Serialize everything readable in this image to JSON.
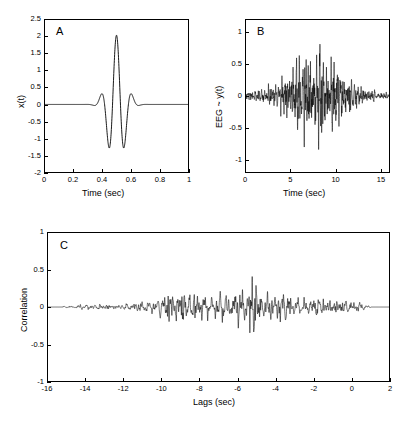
{
  "figure": {
    "background": "#ffffff",
    "line_color": "#000000",
    "panels": [
      {
        "id": "panel-a",
        "letter": "A",
        "xlabel": "Time (sec)",
        "ylabel": "x(t)",
        "xticks": [
          "0",
          "0.2",
          "0.4",
          "0.6",
          "0.8",
          "1"
        ],
        "yticks": [
          "2.5",
          "2",
          "1.5",
          "1",
          "0.5",
          "0",
          "-0.5",
          "-1",
          "-1.5",
          "-2"
        ]
      },
      {
        "id": "panel-b",
        "letter": "B",
        "xlabel": "Time (sec)",
        "ylabel": "EEG ~ y(t)",
        "xticks": [
          "0",
          "5",
          "10",
          "15"
        ],
        "yticks": [
          "1",
          "0.5",
          "0",
          "-0.5",
          "-1"
        ]
      },
      {
        "id": "panel-c",
        "letter": "C",
        "xlabel": "Lags (sec)",
        "ylabel": "Correlation",
        "xticks": [
          "-16",
          "-14",
          "-12",
          "-10",
          "-8",
          "-6",
          "-4",
          "-2",
          "0",
          "2"
        ],
        "yticks": [
          "1",
          "0.5",
          "0",
          "-0.5",
          "-1"
        ]
      }
    ]
  },
  "chart_data": [
    {
      "type": "line",
      "id": "panel-a",
      "title": "A",
      "xlabel": "Time (sec)",
      "ylabel": "x(t)",
      "xlim": [
        0,
        1
      ],
      "ylim": [
        -2,
        2.5
      ],
      "xticks": [
        0,
        0.2,
        0.4,
        0.6,
        0.8,
        1
      ],
      "yticks": [
        -2,
        -1.5,
        -1,
        -0.5,
        0,
        0.5,
        1,
        1.5,
        2,
        2.5
      ],
      "grid": false,
      "legend": "none",
      "description": "Morlet-type wavelet: zero baseline, center at t=0.5, main positive peak 2.05, two flanking troughs near -1.50 at t=0.44 and t=0.565, outer positive bumps near 0.40 at t=0.40 and t=0.615, decaying to zero outside 0.33-0.68",
      "waveform": {
        "model": "morlet",
        "center": 0.5,
        "carrier_frequency_hz": 9.0,
        "gaussian_sigma": 0.055,
        "amplitude": 2.05,
        "samples": 1000
      },
      "key_points": [
        {
          "x": 0.0,
          "y": 0.0
        },
        {
          "x": 0.33,
          "y": 0.0
        },
        {
          "x": 0.385,
          "y": 0.4
        },
        {
          "x": 0.44,
          "y": -1.5
        },
        {
          "x": 0.5,
          "y": 2.05
        },
        {
          "x": 0.565,
          "y": -1.5
        },
        {
          "x": 0.615,
          "y": 0.4
        },
        {
          "x": 0.68,
          "y": 0.0
        },
        {
          "x": 1.0,
          "y": 0.0
        }
      ]
    },
    {
      "type": "line",
      "id": "panel-b",
      "title": "B",
      "xlabel": "Time (sec)",
      "ylabel": "EEG ~ y(t)",
      "xlim": [
        0,
        16
      ],
      "ylim": [
        -1.2,
        1.2
      ],
      "xticks": [
        0,
        5,
        10,
        15
      ],
      "yticks": [
        -1,
        -0.5,
        0,
        0.5,
        1
      ],
      "grid": false,
      "legend": "none",
      "description": "Broadband EEG-like noisy oscillation. Amplitude envelope small (~0.12) at t=0-2, growing through t=3-5, maximal between t=5.5 and t=10.5 with extremes +1.0 at t=6.2 and -1.12 at t=8.5, then decaying to ~0.07 by t=14-16",
      "waveform": {
        "model": "modulated-noise",
        "carrier_frequency_hz": 6.5,
        "envelope_center": 7.8,
        "envelope_sigma": 2.9,
        "envelope_floor": 0.09,
        "peak_amplitude": 1.12,
        "samples": 3000
      },
      "envelope_profile": [
        {
          "t": 0,
          "amp": 0.1
        },
        {
          "t": 2,
          "amp": 0.15
        },
        {
          "t": 3.5,
          "amp": 0.3
        },
        {
          "t": 5,
          "amp": 0.55
        },
        {
          "t": 6.2,
          "amp": 1.0
        },
        {
          "t": 7.5,
          "amp": 0.8
        },
        {
          "t": 8.5,
          "amp": 1.05
        },
        {
          "t": 10,
          "amp": 0.7
        },
        {
          "t": 11.5,
          "amp": 0.4
        },
        {
          "t": 13,
          "amp": 0.18
        },
        {
          "t": 15,
          "amp": 0.08
        },
        {
          "t": 16,
          "amp": 0.06
        }
      ]
    },
    {
      "type": "line",
      "id": "panel-c",
      "title": "C",
      "xlabel": "Lags (sec)",
      "ylabel": "Correlation",
      "xlim": [
        -16,
        2
      ],
      "ylim": [
        -1,
        1
      ],
      "xticks": [
        -16,
        -14,
        -12,
        -10,
        -8,
        -6,
        -4,
        -2,
        0,
        2
      ],
      "yticks": [
        -1,
        -0.5,
        0,
        0.5,
        1
      ],
      "grid": false,
      "legend": "none",
      "description": "Cross-correlation of wavelet x(t) with EEG y(t). Flat zero from -16 to -15.2, low-amplitude ripple (~0.05) from -15 to -11, growing to ~0.45 near -9.3, sustained noisy oscillation between -10 and -1 with global maximum 0.55 at -5.05 and global minimum -0.60 at -5.1, tapering after -1 and flat zero from +1.1 to +2",
      "waveform": {
        "model": "modulated-noise",
        "carrier_frequency_hz": 6.5,
        "envelope_center": -6.2,
        "envelope_sigma": 3.6,
        "peak_amplitude": 0.6,
        "flat_left_edge": -15.2,
        "flat_right_edge": 1.1,
        "samples": 3000
      },
      "envelope_profile": [
        {
          "t": -16,
          "amp": 0.0
        },
        {
          "t": -15.2,
          "amp": 0.01
        },
        {
          "t": -14,
          "amp": 0.05
        },
        {
          "t": -12,
          "amp": 0.06
        },
        {
          "t": -11,
          "amp": 0.09
        },
        {
          "t": -10,
          "amp": 0.18
        },
        {
          "t": -9.3,
          "amp": 0.45
        },
        {
          "t": -8.5,
          "amp": 0.3
        },
        {
          "t": -7.5,
          "amp": 0.25
        },
        {
          "t": -6.5,
          "amp": 0.22
        },
        {
          "t": -5.1,
          "amp": 0.58
        },
        {
          "t": -4.5,
          "amp": 0.4
        },
        {
          "t": -3.5,
          "amp": 0.22
        },
        {
          "t": -2.5,
          "amp": 0.15
        },
        {
          "t": -1.5,
          "amp": 0.2
        },
        {
          "t": -0.5,
          "amp": 0.14
        },
        {
          "t": 0.5,
          "amp": 0.08
        },
        {
          "t": 1.1,
          "amp": 0.0
        },
        {
          "t": 2,
          "amp": 0.0
        }
      ]
    }
  ]
}
